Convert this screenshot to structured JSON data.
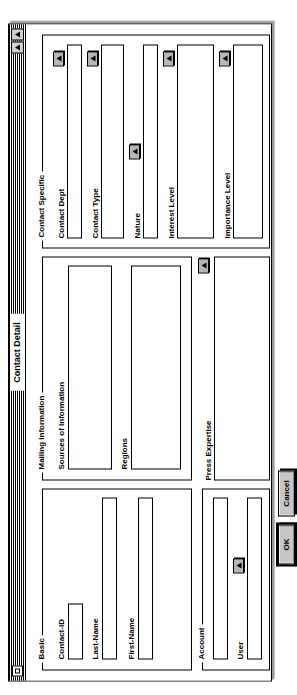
{
  "window": {
    "title": "Contact Detail",
    "close_box": "close-box",
    "zoom_box_1": "zoom-box",
    "zoom_box_2": "zoom-box"
  },
  "sections": {
    "basic": {
      "label": "Basic"
    },
    "mailing": {
      "label": "Mailing Information"
    },
    "contact_specific": {
      "label": "Contact Specific"
    },
    "press_expertise": {
      "label": "Press Expertise"
    },
    "account": {
      "label": "Account"
    }
  },
  "fields": {
    "contact_id": {
      "label": "Contact-ID",
      "value": ""
    },
    "last_name": {
      "label": "Last-Name",
      "value": ""
    },
    "first_name": {
      "label": "First-Name",
      "value": ""
    },
    "sources_of_information": {
      "label": "Sources of Information",
      "value": ""
    },
    "regions": {
      "label": "Regions",
      "value": ""
    },
    "press_expertise": {
      "label": "Press Expertise",
      "value": ""
    },
    "contact_dept": {
      "label": "Contact Dept",
      "value": ""
    },
    "contact_type": {
      "label": "Contact Type",
      "value": ""
    },
    "nature": {
      "label": "Nature",
      "value": ""
    },
    "interest_level": {
      "label": "Interest Level",
      "value": ""
    },
    "importance_level": {
      "label": "Importance Level",
      "value": ""
    },
    "account": {
      "label": "Account",
      "value": ""
    },
    "user": {
      "label": "User",
      "value": ""
    }
  },
  "buttons": {
    "ok": "OK",
    "cancel": "Cancel",
    "popup_press_expertise": "arrow-up-icon",
    "popup_contact_dept": "arrow-up-icon",
    "popup_contact_type": "arrow-up-icon",
    "popup_nature": "arrow-up-icon",
    "popup_interest_level": "arrow-up-icon",
    "popup_importance_level": "arrow-up-icon",
    "popup_user": "arrow-up-icon"
  }
}
